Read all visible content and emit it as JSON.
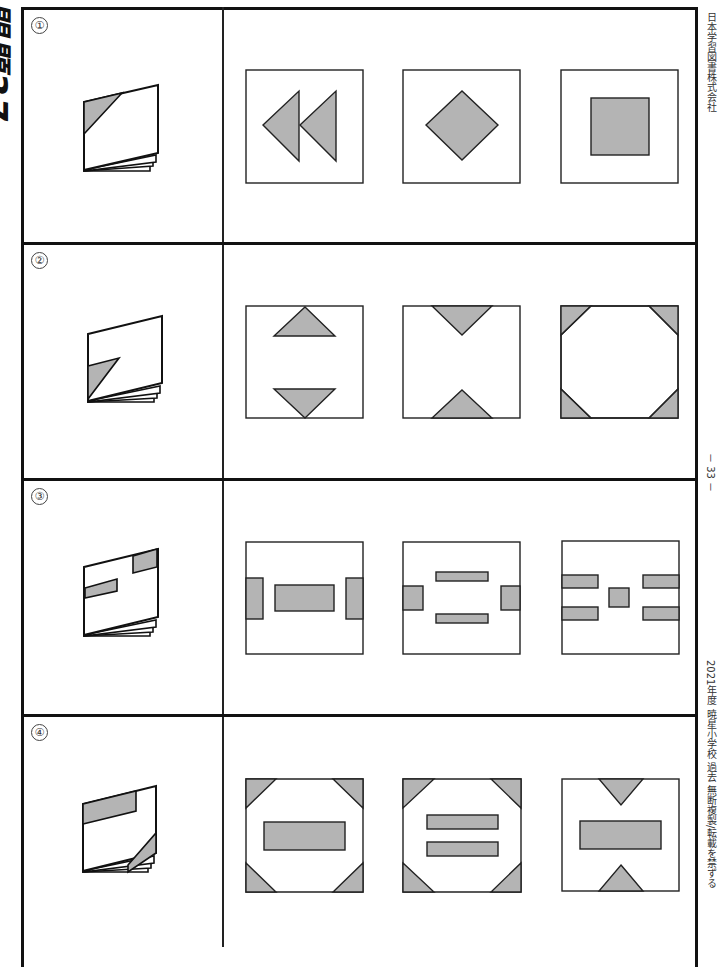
{
  "title": "問題37",
  "page_number": "－ 33 －",
  "publisher": "日本学習図書株式会社",
  "footer_note": "2021年度 暁星小学校 過去 無断複製/転載を禁ずる",
  "colors": {
    "fill": "#b4b4b4",
    "stroke": "#222222",
    "frame": "#111111"
  },
  "problems": [
    {
      "number": "①",
      "folded": "paper folded with top-left triangle shaded",
      "choices": [
        "double-left-triangles",
        "diamond",
        "square"
      ]
    },
    {
      "number": "②",
      "folded": "paper folded with bottom-left triangle shaded",
      "choices": [
        "top-and-bottom-inner-triangles",
        "top-and-bottom-edge-triangles",
        "four-corner-triangles"
      ]
    },
    {
      "number": "③",
      "folded": "paper folded with two rectangles shaded",
      "choices": [
        "side-rects-and-center-rect",
        "side-rects-and-two-bars",
        "four-bars-and-center-square"
      ]
    },
    {
      "number": "④",
      "folded": "paper folded with top band and bottom-right triangle shaded",
      "choices": [
        "corners-and-center-rect",
        "corners-and-two-bars",
        "edge-triangles-and-center-rect"
      ]
    }
  ]
}
